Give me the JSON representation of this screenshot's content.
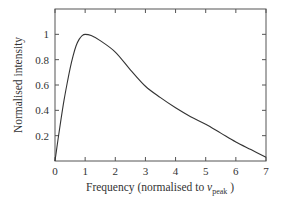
{
  "chart_data": {
    "type": "line",
    "title": "",
    "xlabel": "Frequency (normalised to ν",
    "xlabel_sub": "peak",
    "xlabel_suffix": " )",
    "ylabel": "Normalised intensity",
    "xlim": [
      0,
      7
    ],
    "ylim": [
      0,
      1.2
    ],
    "grid": false,
    "legend": null,
    "xticks": [
      "0",
      "1",
      "2",
      "3",
      "4",
      "5",
      "6",
      "7"
    ],
    "yticks": [
      "0.2",
      "0.4",
      "0.6",
      "0.8",
      "1"
    ],
    "series": [
      {
        "name": "spectrum",
        "x": [
          0,
          0.1,
          0.2,
          0.3,
          0.4,
          0.5,
          0.6,
          0.7,
          0.8,
          0.9,
          1.0,
          1.2,
          1.5,
          2.0,
          2.5,
          3.0,
          3.5,
          4.0,
          4.5,
          5.0,
          5.5,
          6.0,
          6.5,
          7.0
        ],
        "y": [
          0,
          0.17,
          0.33,
          0.48,
          0.61,
          0.73,
          0.83,
          0.91,
          0.96,
          0.99,
          1.0,
          0.99,
          0.95,
          0.86,
          0.72,
          0.59,
          0.5,
          0.42,
          0.35,
          0.29,
          0.22,
          0.15,
          0.09,
          0.03
        ],
        "color": "#333333"
      }
    ]
  },
  "labels": {
    "ylabel": "Normalised intensity",
    "xlabel_main": "Frequency (normalised to ",
    "xlabel_nu": "ν",
    "xlabel_sub": "peak",
    "xlabel_end": " )"
  }
}
